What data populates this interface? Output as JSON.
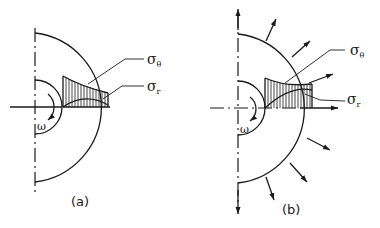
{
  "figure": {
    "panel_a": {
      "caption": "(a)",
      "labels": {
        "sigma_theta": "σ",
        "sigma_theta_sub": "θ",
        "sigma_r": "σ",
        "sigma_r_sub": "r",
        "omega": "ω"
      }
    },
    "panel_b": {
      "caption": "(b)",
      "labels": {
        "sigma_theta": "σ",
        "sigma_theta_sub": "θ",
        "sigma_r": "σ",
        "sigma_r_sub": "r",
        "omega": "ω"
      }
    }
  },
  "colors": {
    "ink": "#1a1a1a",
    "background": "#ffffff"
  }
}
